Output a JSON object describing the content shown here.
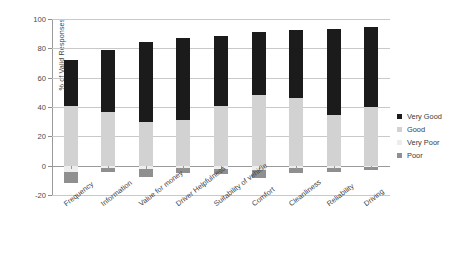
{
  "chart_data": {
    "type": "bar",
    "subtype": "stacked-diverging",
    "title": "",
    "xlabel": "",
    "ylabel": "% of Valid Responses",
    "ylim": [
      -20,
      100
    ],
    "yticks": [
      -20,
      0,
      20,
      40,
      60,
      80,
      100
    ],
    "ytick_labels": [
      "-20",
      "0",
      "20",
      "40",
      "60",
      "80",
      "100"
    ],
    "grid": true,
    "legend_position": "right",
    "categories": [
      "Frequency",
      "Information",
      "Value for money",
      "Driver Helpfulness",
      "Suitability of vehicle",
      "Comfort",
      "Cleanliness",
      "Reliability",
      "Driving"
    ],
    "series": [
      {
        "name": "Very Good",
        "color": "#1b1b1b",
        "values": [
          31.0,
          42.5,
          55.0,
          56.0,
          48.0,
          43.0,
          46.5,
          59.0,
          54.5
        ]
      },
      {
        "name": "Good",
        "color": "#d2d2d2",
        "values": [
          41.0,
          36.5,
          29.5,
          31.0,
          40.5,
          48.0,
          46.0,
          34.5,
          40.0
        ]
      },
      {
        "name": "Very Poor",
        "color": "#ededed",
        "values": [
          -4.0,
          -1.5,
          -2.5,
          -1.5,
          -2.0,
          -3.0,
          -1.5,
          -1.5,
          -1.0
        ]
      },
      {
        "name": "Poor",
        "color": "#8f8f8f",
        "values": [
          -7.5,
          -3.0,
          -5.0,
          -3.5,
          -4.0,
          -5.5,
          -3.5,
          -3.0,
          -2.0
        ]
      }
    ],
    "totals_positive": [
      72.0,
      79.0,
      84.5,
      87.0,
      88.5,
      91.0,
      92.5,
      93.5,
      94.5
    ]
  },
  "legend": {
    "items": [
      {
        "label": "Very Good",
        "color": "#1b1b1b"
      },
      {
        "label": "Good",
        "color": "#d2d2d2"
      },
      {
        "label": "Very Poor",
        "color": "#ededed"
      },
      {
        "label": "Poor",
        "color": "#8f8f8f"
      }
    ]
  }
}
